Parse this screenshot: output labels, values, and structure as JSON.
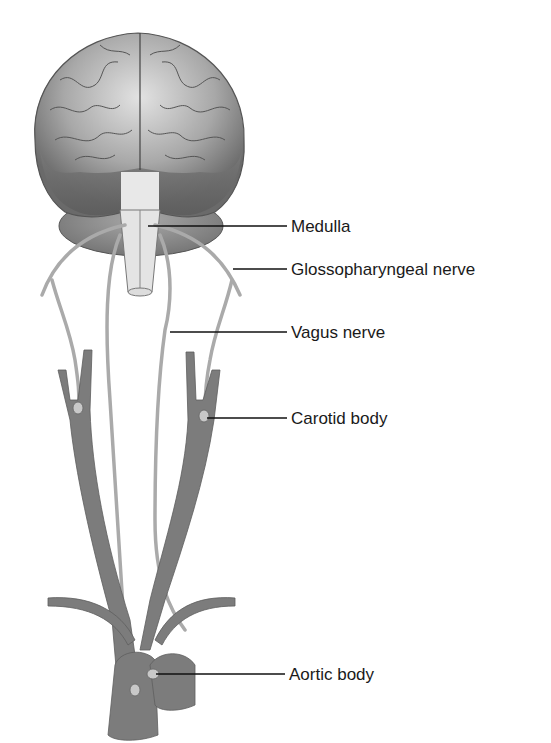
{
  "diagram": {
    "colors": {
      "background": "#ffffff",
      "brain_light": "#c9c9c9",
      "brain_dark": "#6e6e6e",
      "vessel": "#7a7a7a",
      "nerve": "#b0b0b0",
      "medulla": "#e4e4e4",
      "leader_line": "#111111",
      "text": "#1a1a1a"
    },
    "labels": [
      {
        "id": "medulla",
        "text": "Medulla"
      },
      {
        "id": "glossopharyngeal",
        "text": "Glossopharyngeal nerve"
      },
      {
        "id": "vagus",
        "text": "Vagus nerve"
      },
      {
        "id": "carotid",
        "text": "Carotid body"
      },
      {
        "id": "aortic",
        "text": "Aortic body"
      }
    ]
  }
}
